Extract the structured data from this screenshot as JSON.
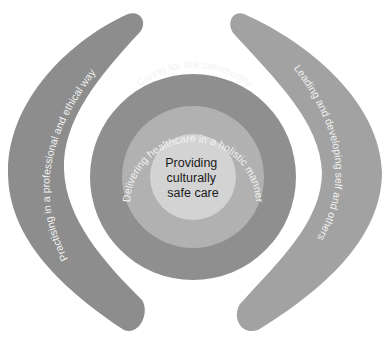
{
  "diagram": {
    "left_band": {
      "label": "Practising in a professional and ethical way",
      "color": "#8d8d8d"
    },
    "right_band": {
      "label": "Leading and developing self and others",
      "color": "#a2a2a2"
    },
    "outer_ring": {
      "label": "Caring for the community",
      "color": "#8f8f8f"
    },
    "middle_ring": {
      "label": "Delivering healthcare in a holistic manner",
      "color": "#b1b1b1"
    },
    "inner_circle": {
      "lines": [
        "Providing",
        "culturally",
        "safe care"
      ],
      "color": "#d3d3d3"
    },
    "text_color": "#f2f2f2"
  }
}
